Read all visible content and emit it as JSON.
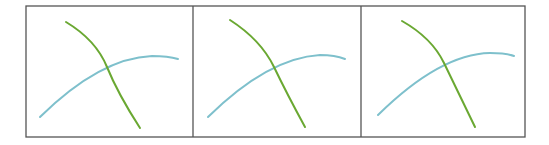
{
  "figure": {
    "frame": {
      "x": 26,
      "y": 6,
      "width": 499,
      "height": 131,
      "stroke": "#555555"
    },
    "dividers": [
      193,
      361
    ],
    "colors": {
      "green_curve": "#6aa832",
      "blue_curve": "#7ec0cc",
      "frame": "#555555",
      "background": "#ffffff"
    },
    "panels": [
      {
        "name": "panel-1",
        "green_path": "M66 22 Q96 40 107 67 T140 128",
        "blue_path": "M40 117 Q100 58 152 56 Q168 56 178 59"
      },
      {
        "name": "panel-2",
        "green_path": "M230 20 Q261 40 274 67 T305 127",
        "blue_path": "M208 117 Q268 58 320 55 Q335 55 345 59"
      },
      {
        "name": "panel-3",
        "green_path": "M402 21 Q432 38 444 63 T475 127",
        "blue_path": "M378 115 Q440 54 490 53 Q505 53 514 56"
      }
    ]
  }
}
